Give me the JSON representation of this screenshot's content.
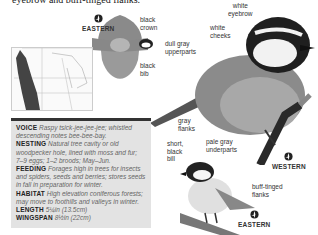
{
  "intro_text": "eyebrow and buff-tinged flanks.",
  "flight_illustration": {
    "region": "EASTERN",
    "labels": [
      "black crown",
      "black bib"
    ]
  },
  "main_illustration": {
    "region": "WESTERN",
    "labels": [
      "white eyebrow",
      "white cheeks",
      "dull gray upperparts",
      "gray flanks",
      "pale gray underparts"
    ]
  },
  "small_illustration": {
    "region": "EASTERN",
    "labels": [
      "short, black bill",
      "buff-tinged flanks"
    ]
  },
  "range_map": {
    "name": "range map"
  },
  "info": [
    {
      "key": "VOICE",
      "value": "Raspy tsick-jee-jee-jee; whistled descending notes bee-bee-bay."
    },
    {
      "key": "NESTING",
      "value": "Natural tree cavity or old woodpecker hole, lined with moss and fur; 7–9 eggs; 1–2 broods; May–Jun."
    },
    {
      "key": "FEEDING",
      "value": "Forages high in trees for insects and spiders, seeds and berries; stores seeds in fall in preparation for winter."
    },
    {
      "key": "HABITAT",
      "value": "High elevation coniferous forests; may move to foothills and valleys in winter."
    },
    {
      "key": "LENGTH",
      "value": "5¼in (13.5cm)"
    },
    {
      "key": "WINGSPAN",
      "value": "8½in (22cm)"
    }
  ],
  "colors": {
    "info_background": "#e3e3e3",
    "info_border": "#333333",
    "range_dark": "#444444"
  }
}
